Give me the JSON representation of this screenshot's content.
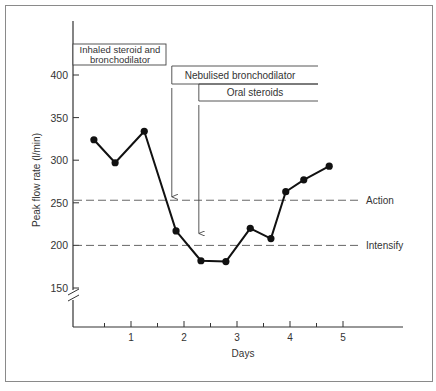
{
  "chart_data": {
    "type": "line",
    "title": "",
    "xlabel": "Days",
    "ylabel": "Peak flow rate (l/min)",
    "xlim": [
      0,
      6
    ],
    "ylim": [
      130,
      420
    ],
    "y_axis_break": true,
    "grid": false,
    "x_ticks": [
      1,
      2,
      3,
      4,
      5
    ],
    "x_tick_labels": [
      "1",
      "2",
      "3",
      "4",
      "5"
    ],
    "x_minor_ticks": [
      0.5,
      1.5,
      2.5,
      3.5,
      4.5
    ],
    "y_ticks": [
      150,
      200,
      250,
      300,
      350,
      400
    ],
    "y_tick_labels": [
      "150",
      "200",
      "250",
      "300",
      "350",
      "400"
    ],
    "series": [
      {
        "name": "Peak flow rate",
        "x": [
          0.3,
          0.7,
          1.25,
          1.85,
          2.32,
          2.79,
          3.25,
          3.64,
          3.92,
          4.26,
          4.74
        ],
        "values": [
          324,
          297,
          334,
          217,
          182,
          181,
          220,
          208,
          263,
          277,
          293
        ]
      }
    ],
    "reference_lines": [
      {
        "label": "Action",
        "value": 253,
        "style": "dashed"
      },
      {
        "label": "Intensify",
        "value": 200,
        "style": "dashed"
      }
    ],
    "annotations": [
      {
        "type": "box",
        "label_lines": [
          "Inhaled steroid and",
          "bronchodilator"
        ],
        "x_start": -0.1,
        "x_end": 1.7
      },
      {
        "type": "bar",
        "label": "Nebulised bronchodilator",
        "x_start": 1.77,
        "x_end": 4.55,
        "arrow_day": 1.77,
        "arrow_to": 257
      },
      {
        "type": "bar",
        "label": "Oral steroids",
        "x_start": 2.28,
        "x_end": 4.55,
        "arrow_day": 2.28,
        "arrow_to": 214
      }
    ],
    "legend": "none"
  }
}
